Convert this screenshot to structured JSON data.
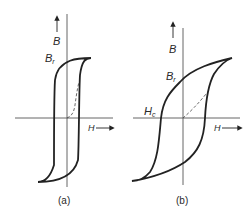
{
  "figure": {
    "panels": [
      {
        "id": "a",
        "caption": "(a)",
        "y_axis_label": "B",
        "x_axis_label": "H",
        "remanence_label": "B",
        "remanence_sub": "r",
        "description": "Square hysteresis loop (hard/square magnetic material) with dashed initial magnetization curve"
      },
      {
        "id": "b",
        "caption": "(b)",
        "y_axis_label": "B",
        "x_axis_label": "H",
        "remanence_label": "B",
        "remanence_sub": "r",
        "coercivity_label": "H",
        "coercivity_sub": "c",
        "description": "Broad S-shaped hysteresis loop with dashed initial magnetization curve"
      }
    ],
    "colors": {
      "line": "#222222",
      "axis": "#555555",
      "background": "#ffffff"
    }
  }
}
